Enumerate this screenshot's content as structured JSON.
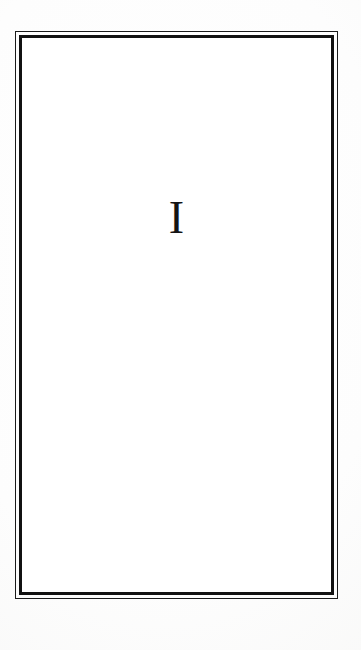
{
  "document": {
    "kind": "scanned-book-page",
    "page_type": "part-divider",
    "background_color": "#fcfcfc",
    "ink_color": "#141414"
  },
  "border": {
    "style": "double-rule",
    "outer_rule_color": "#1a1a1a",
    "inner_rule_color": "#111111",
    "inner_fill_color": "#ffffff"
  },
  "content": {
    "part_numeral": "I"
  }
}
